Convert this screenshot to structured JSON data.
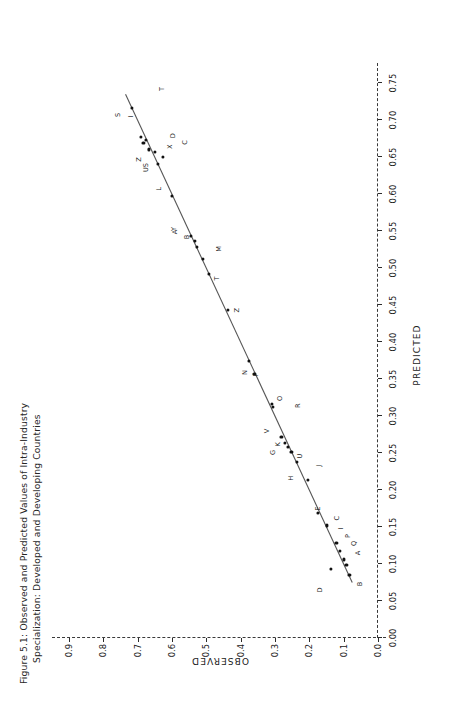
{
  "figure": {
    "caption_line1": "Figure 5.1: Observed and Predicted Values of Intra-Industry",
    "caption_line2": "Specialization: Developed and Developing Countries"
  },
  "chart_data": {
    "type": "scatter",
    "title": "Figure 5.1: Observed and Predicted Values of Intra-Industry Specialization: Developed and Developing Countries",
    "xlabel": "PREDICTED",
    "ylabel": "OBSERVED",
    "xlim": [
      0.0,
      0.765
    ],
    "ylim": [
      0.0,
      0.92
    ],
    "grid": false,
    "legend": "none",
    "orientation": "rotated-90-ccw-on-page",
    "xticks": [
      "0.00",
      "0.05",
      "0.10",
      "0.15",
      "0.20",
      "0.25",
      "0.30",
      "0.35",
      "0.40",
      "0.45",
      "0.50",
      "0.55",
      "0.60",
      "0.65",
      "0.70",
      "0.75"
    ],
    "xtickvalues": [
      0.0,
      0.05,
      0.1,
      0.15,
      0.2,
      0.25,
      0.3,
      0.35,
      0.4,
      0.45,
      0.5,
      0.55,
      0.6,
      0.65,
      0.7,
      0.75
    ],
    "yticks": [
      "0.0",
      "0.1",
      "0.2",
      "0.3",
      "0.4",
      "0.5",
      "0.6",
      "0.7",
      "0.8",
      "0.9"
    ],
    "ytickvalues": [
      0.0,
      0.1,
      0.2,
      0.3,
      0.4,
      0.5,
      0.6,
      0.7,
      0.8,
      0.9
    ],
    "fit_line": {
      "style": "solid",
      "color": "#555555",
      "x": [
        0.075,
        0.735
      ],
      "y": [
        0.075,
        0.735
      ]
    },
    "points": [
      {
        "label": "D",
        "x": 0.093,
        "y": 0.138,
        "label_dx": -0.028,
        "label_dy": 0.03
      },
      {
        "label": "B",
        "x": 0.085,
        "y": 0.083,
        "label_dx": -0.012,
        "label_dy": -0.03
      },
      {
        "label": "A",
        "x": 0.099,
        "y": 0.092,
        "label_dx": 0.016,
        "label_dy": -0.034
      },
      {
        "label": "Q",
        "x": 0.106,
        "y": 0.099,
        "label_dx": 0.022,
        "label_dy": -0.03
      },
      {
        "label": "P",
        "x": 0.118,
        "y": 0.11,
        "label_dx": 0.02,
        "label_dy": -0.022
      },
      {
        "label": "I",
        "x": 0.128,
        "y": 0.121,
        "label_dx": 0.02,
        "label_dy": -0.012
      },
      {
        "label": "C",
        "x": 0.152,
        "y": 0.148,
        "label_dx": 0.01,
        "label_dy": -0.03
      },
      {
        "label": "E",
        "x": 0.169,
        "y": 0.176,
        "label_dx": 0.006,
        "label_dy": 0.0
      },
      {
        "label": "J",
        "x": 0.213,
        "y": 0.203,
        "label_dx": 0.02,
        "label_dy": -0.03
      },
      {
        "label": "H",
        "x": 0.238,
        "y": 0.235,
        "label_dx": -0.022,
        "label_dy": 0.018
      },
      {
        "label": "U",
        "x": 0.251,
        "y": 0.252,
        "label_dx": -0.005,
        "label_dy": -0.024
      },
      {
        "label": "K",
        "x": 0.258,
        "y": 0.262,
        "label_dx": 0.004,
        "label_dy": 0.03
      },
      {
        "label": "G",
        "x": 0.263,
        "y": 0.27,
        "label_dx": -0.012,
        "label_dy": 0.036
      },
      {
        "label": "V",
        "x": 0.272,
        "y": 0.281,
        "label_dx": 0.008,
        "label_dy": 0.043
      },
      {
        "label": "O",
        "x": 0.312,
        "y": 0.306,
        "label_dx": 0.012,
        "label_dy": -0.022
      },
      {
        "label": "R",
        "x": 0.316,
        "y": 0.31,
        "label_dx": -0.002,
        "label_dy": -0.076
      },
      {
        "label": "N",
        "x": 0.357,
        "y": 0.36,
        "label_dx": 0.002,
        "label_dy": 0.026
      },
      {
        "label": "F",
        "x": 0.374,
        "y": 0.376,
        "label_dx": -0.018,
        "label_dy": -0.022
      },
      {
        "label": "Z",
        "x": 0.443,
        "y": 0.438,
        "label_dx": 0.0,
        "label_dy": -0.028
      },
      {
        "label": "T",
        "x": 0.492,
        "y": 0.492,
        "label_dx": -0.006,
        "label_dy": -0.024
      },
      {
        "label": "M",
        "x": 0.512,
        "y": 0.51,
        "label_dx": 0.014,
        "label_dy": -0.048
      },
      {
        "label": "B2",
        "x": 0.528,
        "y": 0.527,
        "label_dx": 0.014,
        "label_dy": 0.03
      },
      {
        "label": "Y",
        "x": 0.537,
        "y": 0.534,
        "label_dx": 0.016,
        "label_dy": 0.06
      },
      {
        "label": "A2",
        "x": 0.543,
        "y": 0.545,
        "label_dx": 0.006,
        "label_dy": 0.046
      },
      {
        "label": "L",
        "x": 0.597,
        "y": 0.601,
        "label_dx": 0.01,
        "label_dy": 0.038
      },
      {
        "label": "US",
        "x": 0.641,
        "y": 0.64,
        "label_dx": -0.005,
        "label_dy": 0.034
      },
      {
        "label": "C2",
        "x": 0.65,
        "y": 0.626,
        "label_dx": 0.02,
        "label_dy": -0.064
      },
      {
        "label": "D2",
        "x": 0.657,
        "y": 0.649,
        "label_dx": 0.022,
        "label_dy": -0.052
      },
      {
        "label": "X",
        "x": 0.66,
        "y": 0.668,
        "label_dx": 0.004,
        "label_dy": -0.062
      },
      {
        "label": "Z2",
        "x": 0.669,
        "y": 0.683,
        "label_dx": -0.022,
        "label_dy": 0.012
      },
      {
        "label": "I2",
        "x": 0.673,
        "y": 0.676,
        "label_dx": 0.032,
        "label_dy": 0.042
      },
      {
        "label": "S",
        "x": 0.677,
        "y": 0.69,
        "label_dx": 0.03,
        "label_dy": 0.068
      },
      {
        "label": "T2",
        "x": 0.716,
        "y": 0.716,
        "label_dx": 0.026,
        "label_dy": -0.088
      }
    ]
  }
}
